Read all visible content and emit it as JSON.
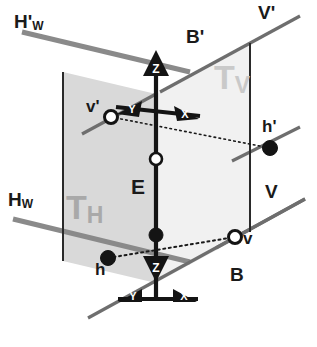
{
  "figure": {
    "canvas": {
      "width": 317,
      "height": 347,
      "background": "#ffffff"
    }
  },
  "colors": {
    "ground_line_gray": "#8a8a8a",
    "plane_label_gray": "#a9a9a9",
    "plane_label_light_gray": "#c9c9c9",
    "left_plane_fill": "#d9d9d9",
    "right_plane_fill": "#f1f1f1",
    "stroke_black": "#141414",
    "point_fill_solid": "#141414",
    "point_fill_hollow": "#ffffff"
  },
  "ground_lines": [
    {
      "id": "hw-prime",
      "label": "H",
      "prime": "'",
      "subscript": "W",
      "label_x": 14,
      "label_y": 18,
      "color": "#8a8a8a",
      "width": 5
    },
    {
      "id": "hw",
      "label": "H",
      "prime": "",
      "subscript": "W",
      "label_x": 8,
      "label_y": 190,
      "color": "#8a8a8a",
      "width": 5
    },
    {
      "id": "v-prime",
      "label": "V",
      "prime": "'",
      "subscript": "",
      "label_x": 258,
      "label_y": 4,
      "color": "#6e6e6e",
      "width": 3
    },
    {
      "id": "v",
      "label": "V",
      "prime": "",
      "subscript": "",
      "label_x": 264,
      "label_y": 183,
      "color": "#6e6e6e",
      "width": 3
    },
    {
      "id": "b-prime",
      "label": "B",
      "prime": "'",
      "subscript": "",
      "label_x": 186,
      "label_y": 30,
      "color": "#141414",
      "width": 3
    },
    {
      "id": "b",
      "label": "B",
      "prime": "",
      "subscript": "",
      "label_x": 230,
      "label_y": 268,
      "color": "#6e6e6e",
      "width": 3
    }
  ],
  "plane_labels": [
    {
      "id": "t-h",
      "base": "T",
      "subscript": "H",
      "x": 66,
      "y": 193,
      "shade": "dark"
    },
    {
      "id": "t-v",
      "base": "T",
      "subscript": "V",
      "x": 214,
      "y": 62,
      "shade": "light"
    }
  ],
  "axes": [
    {
      "id": "axis-z-up",
      "letter": "Z",
      "direction": "up",
      "tip_x": 156,
      "tip_y": 52
    },
    {
      "id": "axis-z-down",
      "letter": "Z",
      "direction": "down",
      "tip_x": 156,
      "tip_y": 280
    },
    {
      "id": "axis-y-upper",
      "letter": "Y",
      "direction": "left",
      "tip_x": 124,
      "tip_y": 110
    },
    {
      "id": "axis-x-upper",
      "letter": "X",
      "direction": "right",
      "tip_x": 190,
      "tip_y": 113
    },
    {
      "id": "axis-y-lower",
      "letter": "Y",
      "direction": "left",
      "tip_x": 127,
      "tip_y": 297
    },
    {
      "id": "axis-x-lower",
      "letter": "X",
      "direction": "right",
      "tip_x": 188,
      "tip_y": 297
    }
  ],
  "segment_label": {
    "id": "segment-e",
    "text": "E",
    "x": 131,
    "y": 178
  },
  "points": [
    {
      "id": "point-v-prime",
      "label": "v'",
      "style": "hollow",
      "cx": 111,
      "cy": 117,
      "label_x": 86,
      "label_y": 101
    },
    {
      "id": "point-h-prime",
      "label": "h'",
      "style": "solid",
      "cx": 270,
      "cy": 148,
      "label_x": 263,
      "label_y": 121
    },
    {
      "id": "point-e-upper",
      "label": "",
      "style": "hollow",
      "cx": 156,
      "cy": 159,
      "label_x": 0,
      "label_y": 0
    },
    {
      "id": "point-e-lower",
      "label": "",
      "style": "solid",
      "cx": 156,
      "cy": 235,
      "label_x": 0,
      "label_y": 0
    },
    {
      "id": "point-v",
      "label": "v",
      "style": "hollow",
      "cx": 235,
      "cy": 237,
      "label_x": 243,
      "label_y": 231
    },
    {
      "id": "point-h",
      "label": "h",
      "style": "solid",
      "cx": 108,
      "cy": 258,
      "label_x": 95,
      "label_y": 263
    }
  ],
  "geometry": {
    "origin_upper": {
      "x": 156,
      "y": 94
    },
    "origin_lower": {
      "x": 156,
      "y": 283
    },
    "left_plane_polygon": "63,72 156,94 156,283 63,261",
    "right_plane_polygon": "156,94 250,43 250,232 156,283",
    "dotted_line_1": "111,117 270,148",
    "dotted_line_2": "108,258 235,237",
    "vertical_segment": "156,94 156,283"
  }
}
